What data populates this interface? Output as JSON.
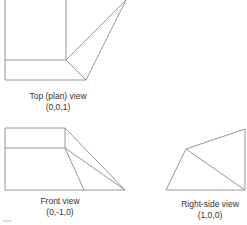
{
  "views": [
    {
      "id": "top",
      "title": "Top (plan) view",
      "direction": "(0,0,1)"
    },
    {
      "id": "front",
      "title": "Front view",
      "direction": "(0,-1,0)"
    },
    {
      "id": "right",
      "title": "Right-side view",
      "direction": "(1,0,0)"
    }
  ],
  "colors": {
    "line": "#8a8a8a"
  }
}
